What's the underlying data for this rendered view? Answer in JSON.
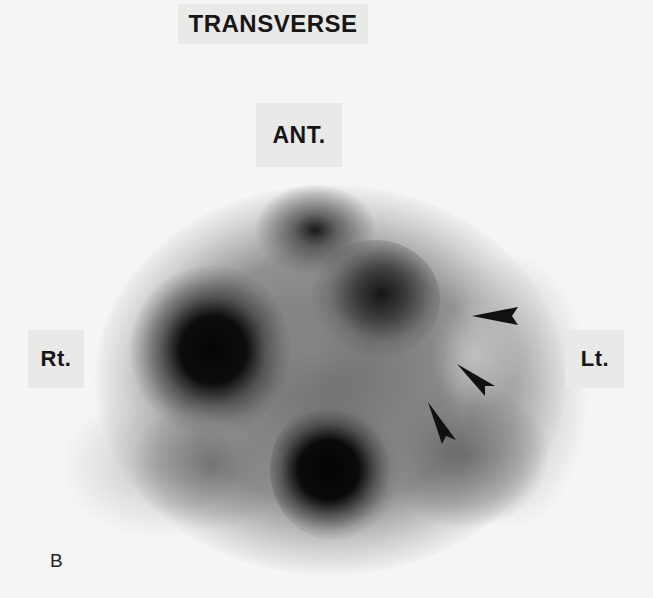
{
  "figure": {
    "title": "TRANSVERSE",
    "panel_letter": "B",
    "orientation_labels": {
      "anterior": "ANT.",
      "right": "Rt.",
      "left": "Lt."
    },
    "image_type": "grayscale tomographic scan, transverse slice",
    "arrowheads": [
      {
        "name": "arrowhead-upper",
        "direction": "pointing-left"
      },
      {
        "name": "arrowhead-middle",
        "direction": "pointing-up-left"
      },
      {
        "name": "arrowhead-lower",
        "direction": "pointing-up-left"
      }
    ],
    "colors": {
      "background": "#f5f5f4",
      "label_box": "#e9e9e8",
      "text": "#161616",
      "max_uptake": "#050505"
    }
  }
}
